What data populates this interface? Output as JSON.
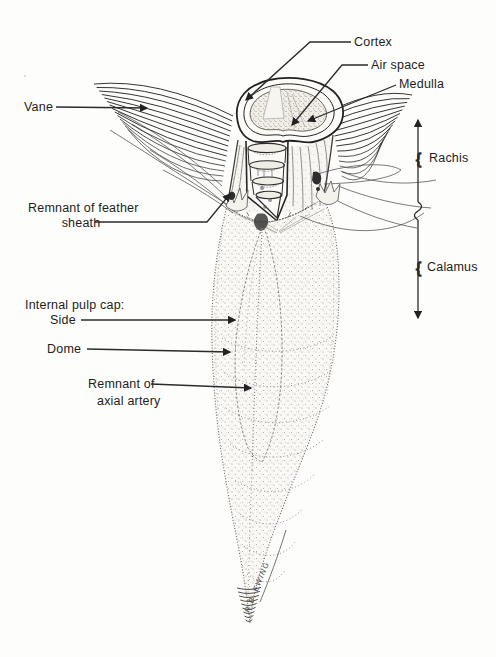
{
  "figure": {
    "labels": {
      "cortex": "Cortex",
      "air_space": "Air space",
      "medulla": "Medulla",
      "vane": "Vane",
      "sheath_line1": "Remnant of feather",
      "sheath_line2": "sheath",
      "pulp_cap_header": "Internal pulp cap:",
      "pulp_cap_side": "Side",
      "pulp_cap_dome": "Dome",
      "artery_line1": "Remnant of",
      "artery_line2": "axial artery",
      "rachis": "Rachis",
      "calamus": "Calamus"
    },
    "signature": "R.B. EWING",
    "brace_glyph": "{",
    "colors": {
      "ink": "#222222",
      "paper": "#fdfdfb"
    }
  }
}
